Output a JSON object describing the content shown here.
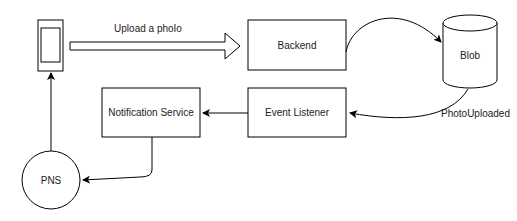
{
  "diagram": {
    "nodes": {
      "phone": {
        "label": "",
        "shape": "phone-icon"
      },
      "backend": {
        "label": "Backend"
      },
      "blob": {
        "label": "Blob",
        "shape": "cylinder"
      },
      "event_listener": {
        "label": "Event Listener"
      },
      "notification_service": {
        "label": "Notification Service"
      },
      "pns": {
        "label": "PNS",
        "shape": "circle"
      }
    },
    "edges": {
      "upload": {
        "label": "Upload a phoIo",
        "from": "phone",
        "to": "backend",
        "style": "hollow-block-arrow"
      },
      "store": {
        "label": "",
        "from": "backend",
        "to": "blob"
      },
      "photo_uploaded": {
        "label": "PhotoUploaded",
        "from": "blob",
        "to": "event_listener"
      },
      "notify": {
        "label": "",
        "from": "event_listener",
        "to": "notification_service"
      },
      "push": {
        "label": "",
        "from": "notification_service",
        "to": "pns"
      },
      "deliver": {
        "label": "",
        "from": "pns",
        "to": "phone"
      }
    },
    "colors": {
      "stroke": "#000000",
      "fill": "#ffffff",
      "text": "#222222"
    }
  }
}
